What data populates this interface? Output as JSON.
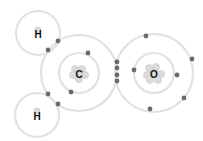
{
  "diagram": {
    "title": "",
    "atoms": [
      {
        "id": "H1",
        "label": "H",
        "cx": 38,
        "cy": 33,
        "shells": [
          22
        ]
      },
      {
        "id": "H2",
        "label": "H",
        "cx": 37,
        "cy": 115,
        "shells": [
          22
        ]
      },
      {
        "id": "C",
        "label": "C",
        "cx": 79,
        "cy": 73,
        "shells": [
          20,
          38
        ]
      },
      {
        "id": "O",
        "label": "O",
        "cx": 154,
        "cy": 73,
        "shells": [
          20,
          39
        ]
      }
    ],
    "electrons": [
      [
        58,
        41
      ],
      [
        48,
        50
      ],
      [
        88,
        53
      ],
      [
        71,
        92
      ],
      [
        48,
        94
      ],
      [
        58,
        104
      ],
      [
        117,
        62
      ],
      [
        117,
        68
      ],
      [
        117,
        75
      ],
      [
        117,
        81
      ],
      [
        146,
        36
      ],
      [
        192,
        59
      ],
      [
        134,
        70
      ],
      [
        177,
        75
      ],
      [
        184,
        98
      ],
      [
        150,
        109
      ]
    ],
    "colors": {
      "shell": "#e2e2e2",
      "electron": "#6b6b6b",
      "nucleus": "#dcdcdc"
    }
  }
}
